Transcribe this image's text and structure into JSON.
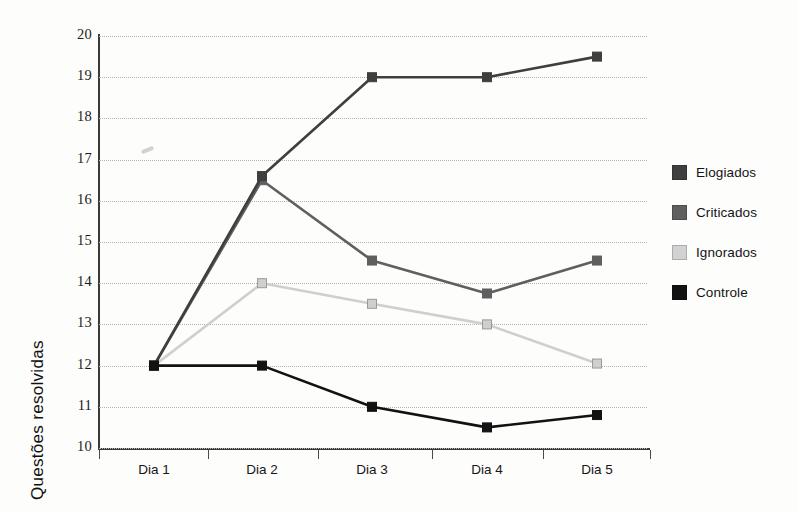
{
  "chart_data": {
    "type": "line",
    "title": "",
    "xlabel": "",
    "ylabel": "Questões resolvidas",
    "categories": [
      "Dia 1",
      "Dia 2",
      "Dia 3",
      "Dia 4",
      "Dia 5"
    ],
    "ylim": [
      10,
      20
    ],
    "y_ticks": [
      10,
      11,
      12,
      13,
      14,
      15,
      16,
      17,
      18,
      19,
      20
    ],
    "grid": "horizontal-dotted",
    "legend_position": "right",
    "marker": "square",
    "series": [
      {
        "name": "Elogiados",
        "color": "#3f3f3f",
        "values": [
          12,
          16.6,
          19,
          19,
          19.5
        ]
      },
      {
        "name": "Criticados",
        "color": "#5f5f5f",
        "values": [
          12,
          16.5,
          14.55,
          13.75,
          14.55
        ]
      },
      {
        "name": "Ignorados",
        "color": "#cfcfcf",
        "values": [
          12,
          14,
          13.5,
          13,
          12.05
        ]
      },
      {
        "name": "Controle",
        "color": "#121212",
        "values": [
          12,
          12,
          11,
          10.5,
          10.8
        ]
      }
    ]
  },
  "legend": {
    "items": [
      {
        "label": "Elogiados",
        "color": "#3f3f3f"
      },
      {
        "label": "Criticados",
        "color": "#5f5f5f"
      },
      {
        "label": "Ignorados",
        "color": "#d2d2d2"
      },
      {
        "label": "Controle",
        "color": "#121212"
      }
    ]
  },
  "axes": {
    "y_title": "Questões resolvidas",
    "y_tick_labels": [
      "20",
      "19",
      "18",
      "17",
      "16",
      "15",
      "14",
      "13",
      "12",
      "11",
      "10"
    ],
    "x_tick_labels": [
      "Dia 1",
      "Dia 2",
      "Dia 3",
      "Dia 4",
      "Dia 5"
    ]
  }
}
